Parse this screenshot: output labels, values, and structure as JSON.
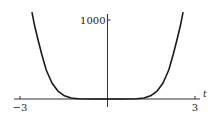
{
  "chart_data": {
    "type": "line",
    "title": "",
    "xlabel": "t",
    "ylabel": "",
    "xlim": [
      -3,
      3
    ],
    "ylim": [
      0,
      1100
    ],
    "x_ticks": [
      {
        "value": -3,
        "label": "−3"
      },
      {
        "value": 3,
        "label": "3"
      }
    ],
    "y_ticks": [
      {
        "value": 1000,
        "label": "1000"
      }
    ],
    "grid": false,
    "legend": null,
    "series": [
      {
        "name": "curve",
        "color": "#1a1a1a",
        "x": [
          -2.59,
          -2.5,
          -2.38,
          -2.25,
          -2.1,
          -1.9,
          -1.7,
          -1.5,
          -1.25,
          -1.0,
          -0.5,
          0,
          0.5,
          1.0,
          1.25,
          1.5,
          1.7,
          1.9,
          2.1,
          2.25,
          2.38,
          2.5,
          2.59
        ],
        "values": [
          1100,
          930,
          747,
          560,
          367,
          200,
          100,
          45,
          12,
          3,
          0,
          0,
          0,
          3,
          12,
          45,
          100,
          200,
          367,
          560,
          747,
          930,
          1100
        ]
      }
    ]
  }
}
